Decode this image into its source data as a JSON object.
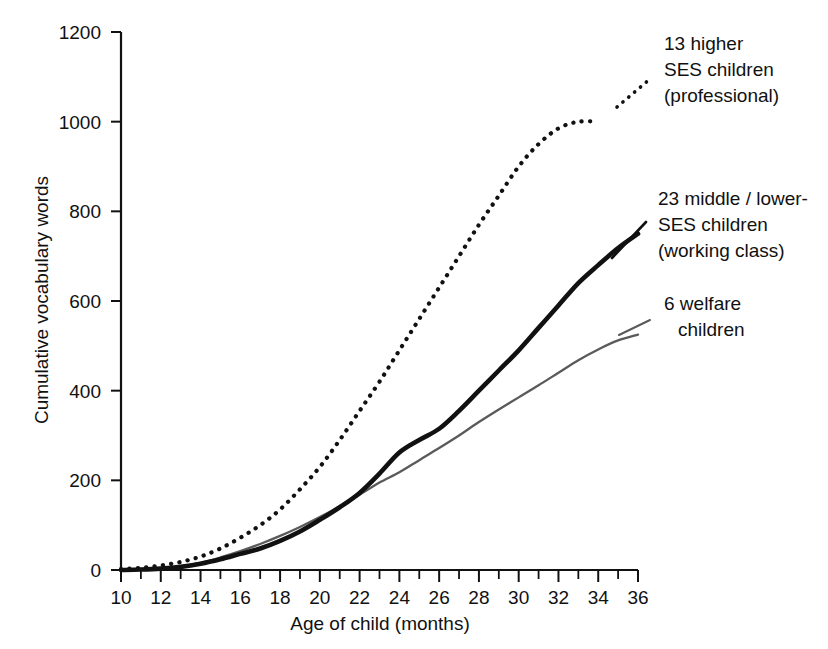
{
  "chart_data": {
    "type": "line",
    "title": "",
    "subtitle": "",
    "xlabel": "Age of child (months)",
    "ylabel": "Cumulative vocabulary words",
    "xlim": [
      10,
      36
    ],
    "ylim": [
      0,
      1200
    ],
    "xticks": [
      10,
      12,
      14,
      16,
      18,
      20,
      22,
      24,
      26,
      28,
      30,
      32,
      34,
      36
    ],
    "xtick_labels": [
      "10",
      "12",
      "14",
      "16",
      "18",
      "20",
      "22",
      "24",
      "26",
      "28",
      "30",
      "32",
      "34",
      "36"
    ],
    "xtick_minor_step": 1,
    "yticks": [
      0,
      200,
      400,
      600,
      800,
      1000,
      1200
    ],
    "ytick_labels": [
      "0",
      "200",
      "400",
      "600",
      "800",
      "1000",
      "1200"
    ],
    "grid": false,
    "legend_position": "inline-annotations",
    "x": [
      10,
      11,
      12,
      13,
      14,
      15,
      16,
      17,
      18,
      19,
      20,
      21,
      22,
      23,
      24,
      25,
      26,
      27,
      28,
      29,
      30,
      31,
      32,
      33,
      34,
      35,
      36
    ],
    "series": [
      {
        "name": "13 higher SES children (professional)",
        "style": "dotted",
        "color": "#111111",
        "x": [
          10,
          11,
          12,
          13,
          14,
          15,
          16,
          17,
          18,
          19,
          20,
          21,
          22,
          23,
          24,
          25,
          26,
          27,
          28,
          29,
          30,
          31,
          32,
          33,
          34
        ],
        "values": [
          2,
          5,
          10,
          18,
          30,
          48,
          72,
          100,
          135,
          180,
          230,
          290,
          355,
          420,
          490,
          560,
          630,
          700,
          770,
          835,
          900,
          950,
          985,
          1000,
          1000
        ],
        "end_month": 34,
        "end_value": 1000
      },
      {
        "name": "23 middle / lower-SES children (working class)",
        "style": "solid-thick",
        "color": "#111111",
        "x": [
          10,
          11,
          12,
          13,
          14,
          15,
          16,
          17,
          18,
          19,
          20,
          21,
          22,
          23,
          24,
          25,
          26,
          27,
          28,
          29,
          30,
          31,
          32,
          33,
          34,
          35,
          36
        ],
        "values": [
          0,
          1,
          3,
          7,
          14,
          24,
          36,
          48,
          65,
          86,
          112,
          140,
          172,
          215,
          262,
          290,
          315,
          355,
          400,
          445,
          490,
          540,
          590,
          640,
          680,
          718,
          750
        ],
        "end_month": 36,
        "end_value": 750
      },
      {
        "name": "6 welfare children",
        "style": "solid-thin",
        "color": "#5a5a5a",
        "x": [
          10,
          11,
          12,
          13,
          14,
          15,
          16,
          17,
          18,
          19,
          20,
          21,
          22,
          23,
          24,
          25,
          26,
          27,
          28,
          29,
          30,
          31,
          32,
          33,
          34,
          35,
          36
        ],
        "values": [
          0,
          1,
          3,
          8,
          16,
          28,
          42,
          58,
          76,
          96,
          118,
          142,
          168,
          195,
          218,
          245,
          272,
          300,
          330,
          358,
          385,
          412,
          440,
          468,
          492,
          512,
          525
        ],
        "end_month": 36,
        "end_value": 525
      }
    ],
    "annotations": [
      {
        "id": "professional",
        "lines": [
          "13 higher",
          "SES children",
          "(professional)"
        ],
        "leader_style": "dotted"
      },
      {
        "id": "working-class",
        "lines": [
          "23 middle / lower-",
          "SES children",
          "(working class)"
        ],
        "leader_style": "solid"
      },
      {
        "id": "welfare",
        "lines": [
          "6 welfare",
          "children"
        ],
        "leader_style": "thin"
      }
    ]
  }
}
